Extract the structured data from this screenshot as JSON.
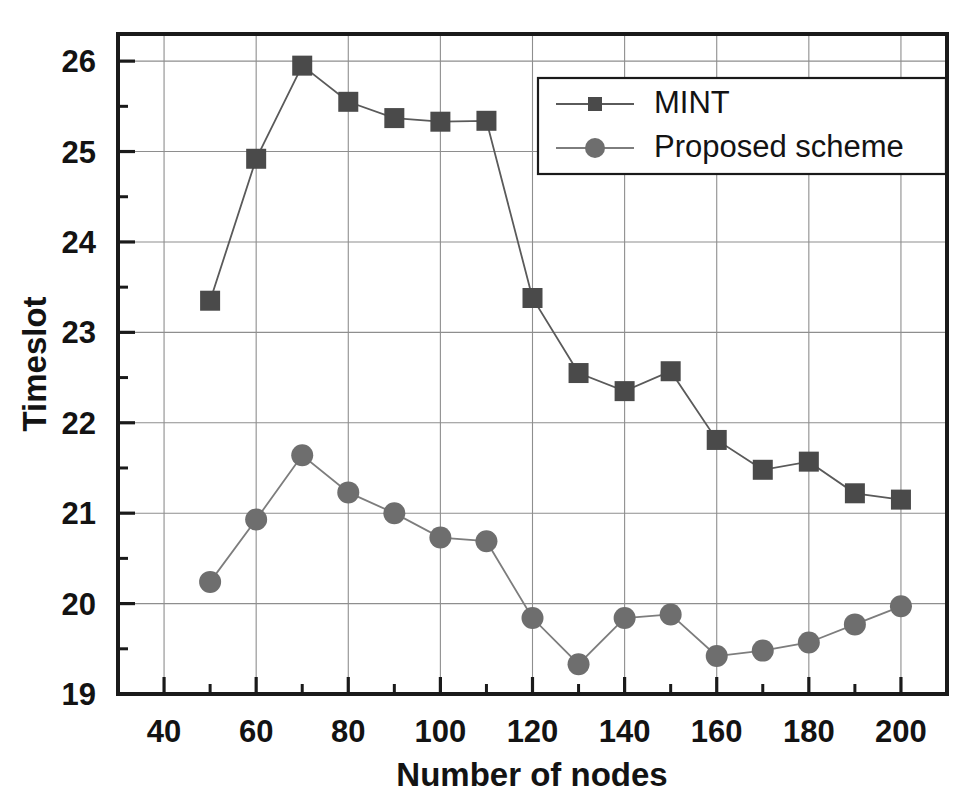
{
  "chart_data": {
    "type": "line",
    "title": "",
    "xlabel": "Number of nodes",
    "ylabel": "Timeslot",
    "xlim": [
      30,
      210
    ],
    "ylim": [
      19,
      26.3
    ],
    "x_ticks": [
      40,
      60,
      80,
      100,
      120,
      140,
      160,
      180,
      200
    ],
    "x_tick_labels": [
      "40",
      "60",
      "80",
      "100",
      "120",
      "140",
      "160",
      "180",
      "200"
    ],
    "x_minor_step": 10,
    "y_ticks": [
      19,
      20,
      21,
      22,
      23,
      24,
      25,
      26
    ],
    "y_tick_labels": [
      "19",
      "20",
      "21",
      "22",
      "23",
      "24",
      "25",
      "26"
    ],
    "y_minor_step": 0.5,
    "grid": true,
    "legend_position": "top-right-inside",
    "x": [
      50,
      60,
      70,
      80,
      90,
      100,
      110,
      120,
      130,
      140,
      150,
      160,
      170,
      180,
      190,
      200
    ],
    "series": [
      {
        "name": "MINT",
        "marker": "square",
        "color": "#4a4a4a",
        "line_color": "#5a5a5a",
        "values": [
          23.35,
          24.92,
          25.95,
          25.55,
          25.37,
          25.33,
          25.34,
          23.38,
          22.55,
          22.35,
          22.57,
          21.81,
          21.48,
          21.57,
          21.22,
          21.15
        ]
      },
      {
        "name": "Proposed scheme",
        "marker": "circle",
        "color": "#6e6e6e",
        "line_color": "#7d7d7d",
        "values": [
          20.24,
          20.93,
          21.64,
          21.23,
          21.0,
          20.73,
          20.69,
          19.84,
          19.33,
          19.84,
          19.88,
          19.42,
          19.48,
          19.57,
          19.77,
          19.97
        ]
      }
    ]
  },
  "legend": {
    "entries": [
      {
        "label": "MINT"
      },
      {
        "label": "Proposed scheme"
      }
    ]
  },
  "axes": {
    "x_title": "Number of nodes",
    "y_title": "Timeslot"
  },
  "colors": {
    "mint": "#4a4a4a",
    "proposed": "#6e6e6e",
    "grid": "#8e8e8e",
    "frame": "#1a1a1a",
    "text": "#131313",
    "background": "#ffffff"
  }
}
